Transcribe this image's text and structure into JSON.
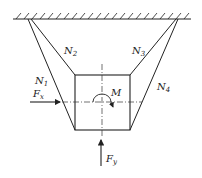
{
  "diagram": {
    "type": "statics-free-body",
    "labels": {
      "n1": {
        "main": "N",
        "sub": "1"
      },
      "n2": {
        "main": "N",
        "sub": "2"
      },
      "n3": {
        "main": "N",
        "sub": "3"
      },
      "n4": {
        "main": "N",
        "sub": "4"
      },
      "fx": {
        "main": "F",
        "sub": "x"
      },
      "fy": {
        "main": "F",
        "sub": "y"
      },
      "m": {
        "main": "M"
      }
    },
    "colors": {
      "line": "#222222",
      "background": "#ffffff"
    }
  }
}
